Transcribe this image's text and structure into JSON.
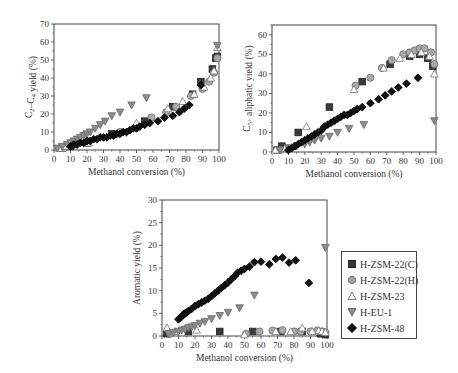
{
  "figure": {
    "legend": {
      "items": [
        {
          "name": "H-ZSM-22(C)",
          "marker": "square",
          "fill": "#3a3a3a",
          "stroke": "#222222"
        },
        {
          "name": "H-ZSM-22(H)",
          "marker": "circle",
          "fill": "#a8a8a8",
          "stroke": "#707070"
        },
        {
          "name": "H-ZSM-23",
          "marker": "triangle-up",
          "fill": "#ffffff",
          "stroke": "#777777"
        },
        {
          "name": "H-EU-1",
          "marker": "triangle-down",
          "fill": "#8c8c8c",
          "stroke": "#6a6a6a"
        },
        {
          "name": "H-ZSM-48",
          "marker": "diamond",
          "fill": "#111111",
          "stroke": "#000000"
        }
      ]
    }
  },
  "chart_data": [
    {
      "id": "c2c4",
      "type": "scatter",
      "title": "",
      "xlabel": "Methanol conversion (%)",
      "ylabel": "C2–C4 yield (%)",
      "ylabel_main": "C",
      "ylabel_sub1": "2",
      "ylabel_mid": "–C",
      "ylabel_sub2": "4",
      "ylabel_tail": " yield (%)",
      "xlim": [
        0,
        100
      ],
      "ylim": [
        0,
        70
      ],
      "xticks": [
        0,
        10,
        20,
        30,
        40,
        50,
        60,
        70,
        80,
        90,
        100
      ],
      "yticks": [
        0,
        10,
        20,
        30,
        40,
        50,
        60,
        70
      ],
      "grid": false,
      "box": {
        "x0": 54,
        "x1": 219,
        "y0": 150,
        "y1": 24
      },
      "series": [
        {
          "name": "H-ZSM-22(C)",
          "points": [
            [
              5,
              1
            ],
            [
              10,
              2
            ],
            [
              20,
              4
            ],
            [
              35,
              9
            ],
            [
              55,
              16
            ],
            [
              72,
              24
            ],
            [
              84,
              31
            ],
            [
              89,
              38
            ],
            [
              96,
              45
            ],
            [
              98,
              51
            ],
            [
              99,
              52
            ]
          ]
        },
        {
          "name": "H-ZSM-22(H)",
          "points": [
            [
              6,
              1
            ],
            [
              12,
              3
            ],
            [
              20,
              5
            ],
            [
              40,
              10
            ],
            [
              59,
              18
            ],
            [
              68,
              21
            ],
            [
              74,
              24
            ],
            [
              83,
              30
            ],
            [
              90,
              34
            ],
            [
              94,
              38
            ],
            [
              97,
              43
            ],
            [
              99,
              51
            ]
          ]
        },
        {
          "name": "H-ZSM-23",
          "points": [
            [
              3,
              1
            ],
            [
              7,
              2
            ],
            [
              21,
              4
            ],
            [
              50,
              15
            ],
            [
              69,
              23
            ],
            [
              78,
              27
            ],
            [
              85,
              31
            ],
            [
              91,
              35
            ],
            [
              95,
              40
            ],
            [
              97,
              44
            ],
            [
              99,
              57
            ]
          ]
        },
        {
          "name": "H-EU-1",
          "points": [
            [
              2,
              1
            ],
            [
              5,
              2
            ],
            [
              8,
              3
            ],
            [
              10,
              4
            ],
            [
              12,
              5
            ],
            [
              14,
              6
            ],
            [
              16,
              7
            ],
            [
              18,
              8
            ],
            [
              20,
              9
            ],
            [
              22,
              10
            ],
            [
              25,
              12
            ],
            [
              28,
              14
            ],
            [
              31,
              16
            ],
            [
              35,
              19
            ],
            [
              40,
              21
            ],
            [
              47,
              25
            ],
            [
              56,
              29
            ],
            [
              99,
              58
            ]
          ]
        },
        {
          "name": "H-ZSM-48",
          "points": [
            [
              10,
              2
            ],
            [
              12,
              3
            ],
            [
              14,
              3
            ],
            [
              16,
              4
            ],
            [
              18,
              4
            ],
            [
              20,
              5
            ],
            [
              22,
              5
            ],
            [
              24,
              6
            ],
            [
              26,
              6
            ],
            [
              28,
              7
            ],
            [
              30,
              7
            ],
            [
              32,
              7
            ],
            [
              34,
              8
            ],
            [
              36,
              8
            ],
            [
              38,
              9
            ],
            [
              40,
              9
            ],
            [
              42,
              10
            ],
            [
              44,
              10
            ],
            [
              46,
              11
            ],
            [
              48,
              12
            ],
            [
              50,
              12
            ],
            [
              52,
              13
            ],
            [
              55,
              14
            ],
            [
              58,
              15
            ],
            [
              63,
              16
            ],
            [
              67,
              18
            ],
            [
              72,
              19
            ],
            [
              76,
              21
            ],
            [
              79,
              23
            ],
            [
              82,
              25
            ],
            [
              89,
              36
            ]
          ]
        }
      ]
    },
    {
      "id": "c5aliph",
      "type": "scatter",
      "title": "",
      "xlabel": "Methanol conversion (%)",
      "ylabel": "C5+ aliphatic yield (%)",
      "ylabel_main": "C",
      "ylabel_sub1": "5+",
      "ylabel_mid": "",
      "ylabel_sub2": "",
      "ylabel_tail": " aliphatic yield (%)",
      "xlim": [
        0,
        100
      ],
      "ylim": [
        0,
        65
      ],
      "xticks": [
        0,
        10,
        20,
        30,
        40,
        50,
        60,
        70,
        80,
        90,
        100
      ],
      "yticks": [
        0,
        10,
        20,
        30,
        40,
        50,
        60
      ],
      "grid": false,
      "box": {
        "x0": 272,
        "x1": 436,
        "y0": 152,
        "y1": 25
      },
      "series": [
        {
          "name": "H-ZSM-22(C)",
          "points": [
            [
              3,
              1
            ],
            [
              6,
              3
            ],
            [
              16,
              10
            ],
            [
              35,
              23
            ],
            [
              55,
              36
            ],
            [
              72,
              45
            ],
            [
              84,
              49
            ],
            [
              90,
              50
            ],
            [
              95,
              48
            ],
            [
              98,
              44
            ]
          ]
        },
        {
          "name": "H-ZSM-22(H)",
          "points": [
            [
              5,
              1
            ],
            [
              10,
              2
            ],
            [
              51,
              34
            ],
            [
              60,
              38
            ],
            [
              67,
              43
            ],
            [
              73,
              47
            ],
            [
              80,
              50
            ],
            [
              84,
              51
            ],
            [
              87,
              52
            ],
            [
              90,
              53
            ],
            [
              93,
              53
            ],
            [
              97,
              51
            ],
            [
              99,
              45
            ]
          ]
        },
        {
          "name": "H-ZSM-23",
          "points": [
            [
              2,
              1
            ],
            [
              8,
              2
            ],
            [
              21,
              13
            ],
            [
              50,
              32
            ],
            [
              68,
              43
            ],
            [
              78,
              48
            ],
            [
              85,
              50
            ],
            [
              91,
              51
            ],
            [
              96,
              49
            ],
            [
              99,
              40
            ]
          ]
        },
        {
          "name": "H-EU-1",
          "points": [
            [
              5,
              1
            ],
            [
              10,
              2
            ],
            [
              15,
              3
            ],
            [
              20,
              4
            ],
            [
              23,
              5
            ],
            [
              26,
              6
            ],
            [
              30,
              7
            ],
            [
              35,
              8
            ],
            [
              40,
              10
            ],
            [
              47,
              12
            ],
            [
              56,
              14
            ],
            [
              99,
              16
            ]
          ]
        },
        {
          "name": "H-ZSM-48",
          "points": [
            [
              10,
              1
            ],
            [
              12,
              2
            ],
            [
              14,
              3
            ],
            [
              16,
              4
            ],
            [
              18,
              5
            ],
            [
              20,
              6
            ],
            [
              22,
              7
            ],
            [
              24,
              8
            ],
            [
              26,
              9
            ],
            [
              28,
              10
            ],
            [
              30,
              11
            ],
            [
              32,
              13
            ],
            [
              34,
              14
            ],
            [
              36,
              15
            ],
            [
              38,
              16
            ],
            [
              40,
              17
            ],
            [
              42,
              18
            ],
            [
              44,
              19
            ],
            [
              46,
              19
            ],
            [
              48,
              20
            ],
            [
              50,
              21
            ],
            [
              52,
              22
            ],
            [
              55,
              23
            ],
            [
              60,
              25
            ],
            [
              65,
              27
            ],
            [
              69,
              29
            ],
            [
              73,
              31
            ],
            [
              77,
              33
            ],
            [
              82,
              35
            ],
            [
              89,
              38
            ]
          ]
        }
      ]
    },
    {
      "id": "aromatic",
      "type": "scatter",
      "title": "",
      "xlabel": "Methanol conversion (%)",
      "ylabel": "Aromatic yield (%)",
      "ylabel_main": "Aromatic yield (%)",
      "ylabel_sub1": "",
      "ylabel_mid": "",
      "ylabel_sub2": "",
      "ylabel_tail": "",
      "xlim": [
        0,
        100
      ],
      "ylim": [
        0,
        30
      ],
      "xticks": [
        0,
        10,
        20,
        30,
        40,
        50,
        60,
        70,
        80,
        90,
        100
      ],
      "yticks": [
        0,
        5,
        10,
        15,
        20,
        25,
        30
      ],
      "grid": false,
      "box": {
        "x0": 162,
        "x1": 327,
        "y0": 336,
        "y1": 200
      },
      "series": [
        {
          "name": "H-ZSM-22(C)",
          "points": [
            [
              3,
              0.5
            ],
            [
              16,
              1
            ],
            [
              35,
              1
            ],
            [
              55,
              1
            ],
            [
              72,
              1
            ],
            [
              85,
              1
            ],
            [
              96,
              0.5
            ],
            [
              99,
              0.3
            ]
          ]
        },
        {
          "name": "H-ZSM-22(H)",
          "points": [
            [
              5,
              0.5
            ],
            [
              51,
              0.5
            ],
            [
              59,
              1
            ],
            [
              67,
              1.2
            ],
            [
              73,
              1.3
            ],
            [
              80,
              1
            ],
            [
              84,
              1
            ],
            [
              90,
              1
            ],
            [
              94,
              1.2
            ],
            [
              97,
              1
            ],
            [
              99,
              0.8
            ]
          ]
        },
        {
          "name": "H-ZSM-23",
          "points": [
            [
              3,
              1.8
            ],
            [
              8,
              1
            ],
            [
              21,
              1.3
            ],
            [
              50,
              0.3
            ],
            [
              69,
              1
            ],
            [
              78,
              1
            ],
            [
              85,
              1.8
            ],
            [
              91,
              1
            ],
            [
              95,
              1.2
            ],
            [
              97,
              1
            ],
            [
              99,
              0.8
            ]
          ]
        },
        {
          "name": "H-EU-1",
          "points": [
            [
              4,
              0.5
            ],
            [
              7,
              0.8
            ],
            [
              10,
              1
            ],
            [
              12,
              1.3
            ],
            [
              14,
              1.5
            ],
            [
              16,
              1.8
            ],
            [
              18,
              2
            ],
            [
              20,
              2.3
            ],
            [
              23,
              2.8
            ],
            [
              26,
              3.2
            ],
            [
              30,
              3.8
            ],
            [
              35,
              4.5
            ],
            [
              40,
              5.2
            ],
            [
              47,
              6.2
            ],
            [
              56,
              9
            ],
            [
              99,
              19.5
            ]
          ]
        },
        {
          "name": "H-ZSM-48",
          "points": [
            [
              10,
              3.7
            ],
            [
              11,
              4
            ],
            [
              12,
              4.3
            ],
            [
              13,
              4.8
            ],
            [
              14,
              5
            ],
            [
              15,
              5.2
            ],
            [
              16,
              5.5
            ],
            [
              18,
              6
            ],
            [
              20,
              6.6
            ],
            [
              22,
              7
            ],
            [
              24,
              7.4
            ],
            [
              26,
              7.8
            ],
            [
              28,
              8.2
            ],
            [
              30,
              8.8
            ],
            [
              32,
              9.4
            ],
            [
              34,
              10
            ],
            [
              36,
              10.6
            ],
            [
              38,
              11.2
            ],
            [
              40,
              11.8
            ],
            [
              42,
              12.5
            ],
            [
              44,
              13.2
            ],
            [
              46,
              14
            ],
            [
              48,
              14.4
            ],
            [
              50,
              14.8
            ],
            [
              53,
              15.3
            ],
            [
              56,
              16.3
            ],
            [
              60,
              16.4
            ],
            [
              65,
              15.8
            ],
            [
              69,
              17
            ],
            [
              73,
              17.3
            ],
            [
              77,
              16.2
            ],
            [
              81,
              16.7
            ],
            [
              89,
              11.7
            ]
          ]
        }
      ]
    }
  ]
}
